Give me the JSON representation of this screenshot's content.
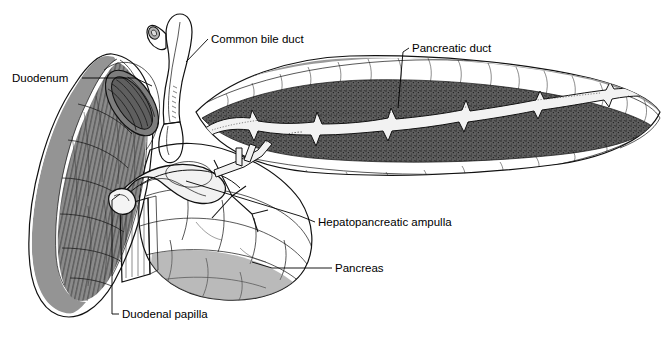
{
  "figure": {
    "background_color": "#ffffff"
  },
  "palette": {
    "organ_gray": "#8b8b8b",
    "organ_gray_dark": "#6e6e6e",
    "stipple_band": "#5e5e5e",
    "duct_white": "#f2f2f2",
    "bile_duct_gray": "#c3c3c3",
    "duodenum_wall": "#8a8a8a",
    "duodenum_wall_dark": "#7a7a7a",
    "lumen_dark": "#6a6a6a",
    "outline_black": "#111111",
    "label_text": "#000000"
  },
  "labels": [
    {
      "id": "duodenum",
      "text": "Duodenum",
      "text_x": 12,
      "text_y": 82,
      "anchor": "start",
      "leader": "M 82,78 L 135,78 L 152,86"
    },
    {
      "id": "common-bile-duct",
      "text": "Common bile duct",
      "text_x": 211,
      "text_y": 43,
      "anchor": "start",
      "leader": "M 208,39 L 186,62"
    },
    {
      "id": "pancreatic-duct",
      "text": "Pancreatic duct",
      "text_x": 412,
      "text_y": 52,
      "anchor": "start",
      "leader": "M 409,48 L 403,52 L 398,108"
    },
    {
      "id": "hepatopancreatic-ampulla",
      "text": "Hepatopancreatic ampulla",
      "text_x": 318,
      "text_y": 226,
      "anchor": "start",
      "leader": "M 315,222 L 300,216 L 186,181"
    },
    {
      "id": "pancreas",
      "text": "Pancreas",
      "text_x": 335,
      "text_y": 272,
      "anchor": "start",
      "leader": "M 332,268 L 272,268 L 252,262"
    },
    {
      "id": "duodenal-papilla",
      "text": "Duodenal papilla",
      "text_x": 122,
      "text_y": 318,
      "anchor": "start",
      "leader": "M 119,314 L 112,314 L 112,200 L 120,194"
    }
  ],
  "structures": [
    {
      "id": "duodenum-wall",
      "name": "Duodenum wall (cut crescent)"
    },
    {
      "id": "duodenum-lumen",
      "name": "Duodenal lumen opening"
    },
    {
      "id": "duodenum-mucosa",
      "name": "Duodenal mucosal folds"
    },
    {
      "id": "common-bile-duct",
      "name": "Common bile duct (Y branch)"
    },
    {
      "id": "pancreas-body",
      "name": "Pancreas body and tail"
    },
    {
      "id": "pancreas-head",
      "name": "Head of pancreas"
    },
    {
      "id": "pancreatic-duct",
      "name": "Main pancreatic duct with branches"
    },
    {
      "id": "accessory-ducts",
      "name": "Accessory branching ductules"
    },
    {
      "id": "ampulla",
      "name": "Hepatopancreatic ampulla"
    },
    {
      "id": "duodenal-papilla",
      "name": "Major duodenal papilla"
    }
  ]
}
